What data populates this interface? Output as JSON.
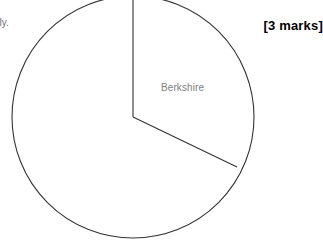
{
  "page": {
    "width": 323,
    "height": 249,
    "background": "#ffffff"
  },
  "question_text": {
    "fragment_label": "ely.",
    "marks_label": "[3 marks]"
  },
  "chart_data": {
    "type": "pie",
    "title": "",
    "subtitle": "",
    "xlabel": "",
    "ylabel": "",
    "legend_position": "none",
    "grid": false,
    "labelled_slice": "Berkshire",
    "categories": [
      "Berkshire",
      "Unlabelled remainder"
    ],
    "values": [
      32,
      68
    ],
    "unit": "percent",
    "slice_angles_deg": [
      115.7,
      244.3
    ],
    "start_angle_deg": 0,
    "direction": "clockwise",
    "annotations": [
      "Berkshire"
    ],
    "geometry": {
      "center_x": 133,
      "center_y": 117,
      "radius": 121,
      "outline_color": "#333333",
      "fill_color": "#ffffff",
      "stroke_width": 1.1,
      "radius_line_1_angle_deg": 0,
      "radius_line_2_angle_deg": 115.7,
      "radius_line_2_end_x": 237,
      "radius_line_2_end_y": 167,
      "clipped_top": true
    },
    "labels": {
      "berkshire": {
        "text": "Berkshire",
        "color": "#808080",
        "x": 161,
        "y": 82,
        "font_size": 10
      }
    }
  }
}
